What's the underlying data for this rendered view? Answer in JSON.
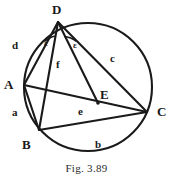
{
  "figure": {
    "caption": "Fig. 3.89",
    "stroke_color": "#1a1a1a",
    "background_color": "#ffffff",
    "circle": {
      "cx": 88,
      "cy": 87,
      "r": 64
    },
    "points": [
      {
        "id": "D",
        "label": "D",
        "x": 58,
        "y": 22,
        "label_x": 52,
        "label_y": 3
      },
      {
        "id": "A",
        "label": "A",
        "x": 24,
        "y": 85,
        "label_x": 4,
        "label_y": 78
      },
      {
        "id": "B",
        "label": "B",
        "x": 39,
        "y": 130,
        "label_x": 22,
        "label_y": 138
      },
      {
        "id": "C",
        "label": "C",
        "x": 147,
        "y": 112,
        "label_x": 157,
        "label_y": 105
      },
      {
        "id": "E",
        "label": "E",
        "x": 98,
        "y": 103,
        "label_x": 100,
        "label_y": 88
      }
    ],
    "segments": [
      {
        "id": "d",
        "from": "D",
        "to": "A",
        "label": "d",
        "label_x": 12,
        "label_y": 40
      },
      {
        "id": "f",
        "from": "D",
        "to": "B",
        "label": "f",
        "label_x": 56,
        "label_y": 59
      },
      {
        "id": "c",
        "from": "D",
        "to": "C",
        "label": "c",
        "label_x": 110,
        "label_y": 53
      },
      {
        "id": "a",
        "from": "A",
        "to": "B",
        "label": "a",
        "label_x": 12,
        "label_y": 107
      },
      {
        "id": "b",
        "from": "B",
        "to": "C",
        "label": "b",
        "label_x": 95,
        "label_y": 139
      },
      {
        "id": "e",
        "from": "A",
        "to": "C",
        "label": "e",
        "label_x": 78,
        "label_y": 106
      },
      {
        "id": "DE",
        "from": "D",
        "to": "E",
        "label": "",
        "label_x": 0,
        "label_y": 0
      }
    ],
    "angles": [
      {
        "id": "angle-ADB",
        "label": "ε",
        "label_x": 44,
        "label_y": 39,
        "arc": "M 44.5 41.5 A 22 22 0 0 1 55.5 36.0"
      },
      {
        "id": "angle-EDC",
        "label": "ε",
        "label_x": 73,
        "label_y": 41,
        "arc": "M 64.0 36.0 A 22 22 0 0 1 76.0 41.0"
      }
    ]
  }
}
